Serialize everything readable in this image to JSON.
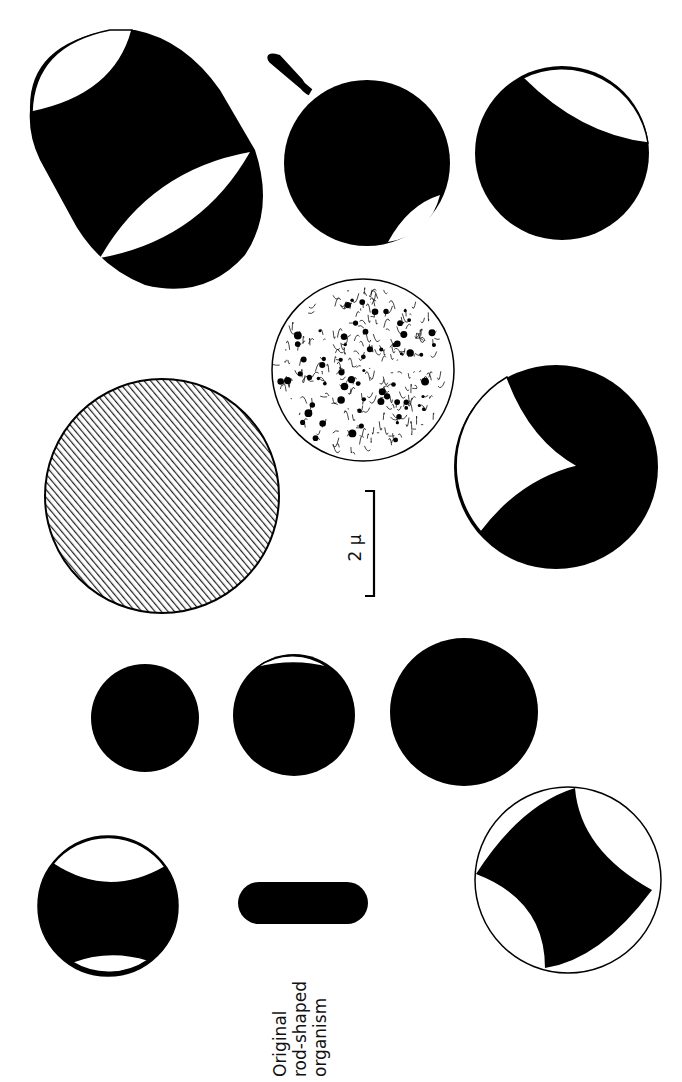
{
  "figure": {
    "caption_label": [
      "Original",
      "rod-shaped",
      "organism"
    ],
    "scale_bar_label": "2 μ",
    "colors": {
      "ink": "#000000",
      "paper": "#ffffff"
    }
  },
  "shapes": [
    {
      "id": "rod",
      "kind": "rod",
      "cx": 303,
      "cy": 903,
      "w": 130,
      "h": 42
    },
    {
      "id": "hatched-sphere",
      "kind": "hatched",
      "cx": 162,
      "cy": 496,
      "r": 117
    },
    {
      "id": "granular-sphere",
      "kind": "granular",
      "cx": 363,
      "cy": 370,
      "r": 91
    },
    {
      "id": "small-solid",
      "kind": "solid",
      "cx": 145,
      "cy": 718,
      "r": 54
    },
    {
      "id": "large-solid",
      "kind": "solid",
      "cx": 464,
      "cy": 712,
      "r": 74
    }
  ]
}
